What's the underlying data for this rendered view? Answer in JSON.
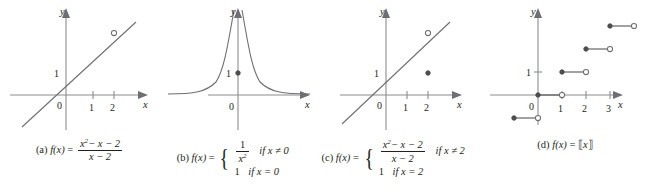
{
  "figure": {
    "width": 645,
    "height": 190,
    "background": "#ffffff",
    "axis_color": "#8c8c8c",
    "curve_color": "#6e6e73",
    "text_color": "#231f20"
  },
  "panels": [
    {
      "id": "a",
      "label": "(a)",
      "function_name": "f(x)",
      "caption_text": "(a) f(x) = (x² − x − 2)/(x − 2)",
      "numerator": "x² − x − 2",
      "denominator": "x − 2",
      "axis_labels": {
        "x": "x",
        "y": "y",
        "origin": "0"
      },
      "x_ticks": [
        "1",
        "2"
      ],
      "y_ticks": [
        "1"
      ],
      "graph_type": "line-with-removable-discontinuity",
      "line_equation": "y = x + 1",
      "open_points": [
        [
          2,
          3
        ]
      ],
      "filled_points": []
    },
    {
      "id": "b",
      "label": "(b)",
      "function_name": "f(x)",
      "caption_text": "(b) f(x) = { 1/x² if x ≠ 0 ; 1 if x = 0 }",
      "case1_value_numerator": "1",
      "case1_value_denominator": "x²",
      "case1_condition": "if x ≠ 0",
      "case2_value": "1",
      "case2_condition": "if x = 0",
      "axis_labels": {
        "x": "x",
        "y": "y",
        "origin": "0"
      },
      "x_ticks": [],
      "y_ticks": [
        "1"
      ],
      "graph_type": "reciprocal-square-with-point",
      "open_points": [],
      "filled_points": [
        [
          0,
          1
        ]
      ]
    },
    {
      "id": "c",
      "label": "(c)",
      "function_name": "f(x)",
      "caption_text": "(c) f(x) = { (x² − x − 2)/(x − 2) if x ≠ 2 ; 1 if x = 2 }",
      "case1_numerator": "x² − x − 2",
      "case1_denominator": "x − 2",
      "case1_condition": "if x ≠ 2",
      "case2_value": "1",
      "case2_condition": "if x = 2",
      "axis_labels": {
        "x": "x",
        "y": "y",
        "origin": "0"
      },
      "x_ticks": [
        "1",
        "2"
      ],
      "y_ticks": [
        "1"
      ],
      "graph_type": "line-with-jump-point",
      "line_equation": "y = x + 1",
      "open_points": [
        [
          2,
          3
        ]
      ],
      "filled_points": [
        [
          2,
          1
        ]
      ]
    },
    {
      "id": "d",
      "label": "(d)",
      "function_name": "f(x)",
      "caption_text": "(d) f(x) = ⟦x⟧",
      "bracket_open": "⟦",
      "bracket_close": "⟧",
      "variable": "x",
      "axis_labels": {
        "x": "x",
        "y": "y",
        "origin": "0"
      },
      "x_ticks": [
        "1",
        "2",
        "3"
      ],
      "y_ticks": [
        "1"
      ],
      "graph_type": "greatest-integer-step",
      "steps": [
        {
          "y": -1,
          "x_from": -1,
          "x_to": 0
        },
        {
          "y": 0,
          "x_from": 0,
          "x_to": 1
        },
        {
          "y": 1,
          "x_from": 1,
          "x_to": 2
        },
        {
          "y": 2,
          "x_from": 2,
          "x_to": 3
        },
        {
          "y": 3,
          "x_from": 3,
          "x_to": 4
        }
      ],
      "filled_points": [
        [
          -1,
          -1
        ],
        [
          0,
          0
        ],
        [
          1,
          1
        ],
        [
          2,
          2
        ],
        [
          3,
          3
        ]
      ],
      "open_points": [
        [
          0,
          -1
        ],
        [
          1,
          0
        ],
        [
          2,
          1
        ],
        [
          3,
          2
        ],
        [
          4,
          3
        ]
      ]
    }
  ]
}
